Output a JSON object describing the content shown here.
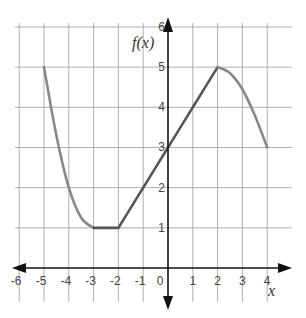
{
  "chart_data": {
    "type": "line",
    "title": "",
    "xlabel": "x",
    "ylabel": "f(x)",
    "xlim": [
      -6,
      4
    ],
    "ylim": [
      0,
      6
    ],
    "grid": true,
    "legend": null,
    "x_ticks": [
      "-6",
      "-5",
      "-4",
      "-3",
      "-2",
      "-1",
      "0",
      "1",
      "2",
      "3",
      "4"
    ],
    "y_ticks": [
      "1",
      "2",
      "3",
      "4",
      "5",
      "6"
    ],
    "series": [
      {
        "name": "f(x)",
        "segments": [
          {
            "kind": "curve",
            "description": "decreasing concave-up curve",
            "points": [
              [
                -5,
                5
              ],
              [
                -4.5,
                3.3
              ],
              [
                -4,
                2
              ],
              [
                -3.5,
                1.25
              ],
              [
                -3,
                1
              ]
            ]
          },
          {
            "kind": "line",
            "points": [
              [
                -3,
                1
              ],
              [
                -2,
                1
              ]
            ]
          },
          {
            "kind": "line",
            "points": [
              [
                -2,
                1
              ],
              [
                2,
                5
              ]
            ]
          },
          {
            "kind": "curve",
            "description": "decreasing concave-down curve",
            "points": [
              [
                2,
                5
              ],
              [
                2.5,
                4.85
              ],
              [
                3,
                4.45
              ],
              [
                3.5,
                3.8
              ],
              [
                4,
                3
              ]
            ]
          }
        ]
      }
    ],
    "colors": {
      "curve": "#888888",
      "line": "#555555",
      "axis": "#111111",
      "grid": "#b0b0b0"
    }
  }
}
